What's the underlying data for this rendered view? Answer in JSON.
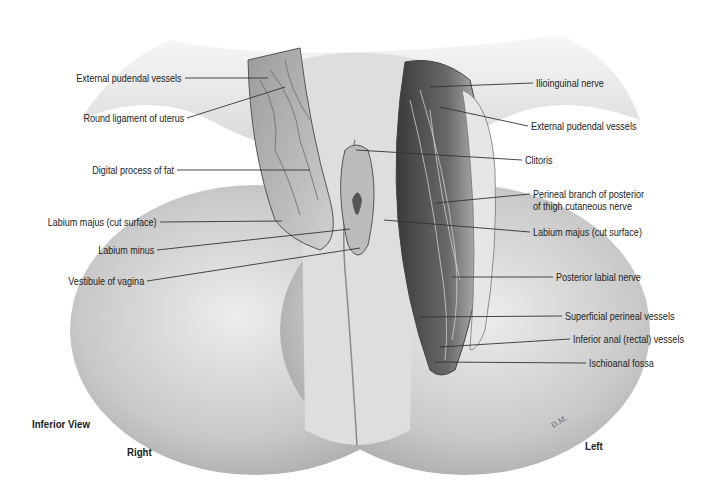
{
  "figure": {
    "view": "Inferior View",
    "orientation": {
      "right": "Right",
      "left": "Left"
    },
    "signature": "D.M.",
    "left_labels": [
      {
        "text": "External pudendal vessels",
        "x": 185,
        "y": 78,
        "tx": 268,
        "ty": 78
      },
      {
        "text": "Round ligament of uterus",
        "x": 187,
        "y": 118,
        "tx": 285,
        "ty": 87
      },
      {
        "text": "Digital process of fat",
        "x": 177,
        "y": 170,
        "tx": 310,
        "ty": 170
      },
      {
        "text": "Labium majus (cut surface)",
        "x": 160,
        "y": 222,
        "tx": 282,
        "ty": 221
      },
      {
        "text": "Labium minus",
        "x": 157,
        "y": 250,
        "tx": 350,
        "ty": 229
      },
      {
        "text": "Vestibule of vagina",
        "x": 147,
        "y": 281,
        "tx": 360,
        "ty": 248
      }
    ],
    "right_labels": [
      {
        "lines": [
          "Ilioinguinal nerve"
        ],
        "x": 533,
        "y": 83,
        "tx": 430,
        "ty": 87
      },
      {
        "lines": [
          "External pudendal vessels"
        ],
        "x": 528,
        "y": 126,
        "tx": 440,
        "ty": 107
      },
      {
        "lines": [
          "Clitoris"
        ],
        "x": 522,
        "y": 160,
        "tx": 356,
        "ty": 150
      },
      {
        "lines": [
          "Perineal branch of posterior",
          "of thigh cutaneous nerve"
        ],
        "x": 530,
        "y": 194,
        "tx": 436,
        "ty": 203
      },
      {
        "lines": [
          "Labium majus (cut surface)"
        ],
        "x": 530,
        "y": 232,
        "tx": 384,
        "ty": 220
      },
      {
        "lines": [
          "Posterior labial nerve"
        ],
        "x": 553,
        "y": 277,
        "tx": 452,
        "ty": 277
      },
      {
        "lines": [
          "Superficial perineal vessels"
        ],
        "x": 562,
        "y": 316,
        "tx": 420,
        "ty": 317
      },
      {
        "lines": [
          "Inferior anal (rectal) vessels"
        ],
        "x": 570,
        "y": 339,
        "tx": 440,
        "ty": 347
      },
      {
        "lines": [
          "Ischioanal fossa"
        ],
        "x": 586,
        "y": 363,
        "tx": 435,
        "ty": 362
      }
    ]
  },
  "colors": {
    "text": "#222222",
    "line": "#333333",
    "skin_light": "#f2f2f2",
    "skin_mid": "#c8c8c8",
    "skin_dark": "#8a8a8a",
    "tissue": "#5a5a5a"
  }
}
